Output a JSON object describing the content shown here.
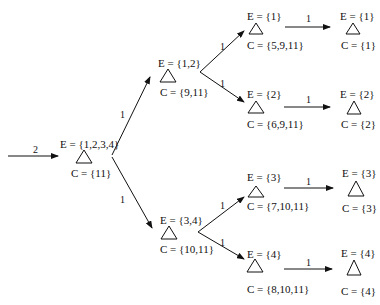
{
  "diagram": {
    "type": "tree",
    "edge_color": "#111111",
    "input_edge": {
      "label": "2"
    },
    "nodes": [
      {
        "id": "root",
        "E": "E = {1,2,3,4}",
        "C": "C = {11}"
      },
      {
        "id": "n12",
        "E": "E = {1,2}",
        "C": "C = {9,11}"
      },
      {
        "id": "n34",
        "E": "E = {3,4}",
        "C": "C = {10,11}"
      },
      {
        "id": "n1",
        "E": "E = {1}",
        "C": "C = {5,9,11}"
      },
      {
        "id": "n2",
        "E": "E = {2}",
        "C": "C = {6,9,11}"
      },
      {
        "id": "n3",
        "E": "E = {3}",
        "C": "C = {7,10,11}"
      },
      {
        "id": "n4",
        "E": "E = {4}",
        "C": "C = {8,10,11}"
      },
      {
        "id": "l1",
        "E": "E = {1}",
        "C": "C = {1}"
      },
      {
        "id": "l2",
        "E": "E = {2}",
        "C": "C = {2}"
      },
      {
        "id": "l3",
        "E": "E = {3}",
        "C": "C = {3}"
      },
      {
        "id": "l4",
        "E": "E = {4}",
        "C": "C = {4}"
      }
    ],
    "edges": [
      {
        "from": "root",
        "to": "n12",
        "label": "1"
      },
      {
        "from": "root",
        "to": "n34",
        "label": "1"
      },
      {
        "from": "n12",
        "to": "n1",
        "label": "1"
      },
      {
        "from": "n12",
        "to": "n2",
        "label": "1"
      },
      {
        "from": "n34",
        "to": "n3",
        "label": "1"
      },
      {
        "from": "n34",
        "to": "n4",
        "label": "1"
      },
      {
        "from": "n1",
        "to": "l1",
        "label": "1"
      },
      {
        "from": "n2",
        "to": "l2",
        "label": "1"
      },
      {
        "from": "n3",
        "to": "l3",
        "label": "1"
      },
      {
        "from": "n4",
        "to": "l4",
        "label": "1"
      }
    ]
  }
}
